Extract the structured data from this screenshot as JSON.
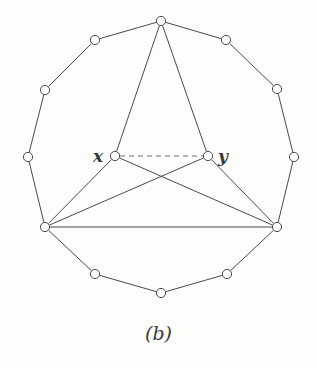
{
  "figure": {
    "caption": "(b)",
    "vertex_labels": {
      "x": "x",
      "y": "y"
    },
    "colors": {
      "edge": "#4a4a4d",
      "dashed_edge": "#6f6f72",
      "node_stroke": "#4a4a4d",
      "node_fill": "#ffffff",
      "text": "#39383b",
      "background": "#fdfdfc"
    },
    "style": {
      "node_radius": 4.6,
      "edge_width": 1.0,
      "dash_pattern": "5,4"
    }
  },
  "chart_data": {
    "type": "diagram",
    "title": "(b)",
    "subtitle": "",
    "vertices": [
      {
        "id": "v0",
        "label": "",
        "x": 161,
        "y": 21,
        "role": "apex"
      },
      {
        "id": "v1",
        "label": "",
        "x": 226,
        "y": 40,
        "role": "cycle"
      },
      {
        "id": "v2",
        "label": "",
        "x": 277,
        "y": 89,
        "role": "cycle"
      },
      {
        "id": "v3",
        "label": "",
        "x": 294,
        "y": 157,
        "role": "cycle"
      },
      {
        "id": "v4",
        "label": "",
        "x": 277,
        "y": 227,
        "role": "hub-right"
      },
      {
        "id": "v5",
        "label": "",
        "x": 227,
        "y": 274,
        "role": "cycle"
      },
      {
        "id": "v6",
        "label": "",
        "x": 161,
        "y": 293,
        "role": "cycle"
      },
      {
        "id": "v7",
        "label": "",
        "x": 95,
        "y": 274,
        "role": "cycle"
      },
      {
        "id": "v8",
        "label": "",
        "x": 45,
        "y": 227,
        "role": "hub-left"
      },
      {
        "id": "v9",
        "label": "",
        "x": 28,
        "y": 157,
        "role": "cycle"
      },
      {
        "id": "v10",
        "label": "",
        "x": 45,
        "y": 90,
        "role": "cycle"
      },
      {
        "id": "v11",
        "label": "",
        "x": 95,
        "y": 40,
        "role": "cycle"
      },
      {
        "id": "vx",
        "label": "x",
        "x": 115,
        "y": 156,
        "role": "inner-left"
      },
      {
        "id": "vy",
        "label": "y",
        "x": 208,
        "y": 156,
        "role": "inner-right"
      }
    ],
    "edges": [
      {
        "from": "v0",
        "to": "v1",
        "style": "solid"
      },
      {
        "from": "v1",
        "to": "v2",
        "style": "solid"
      },
      {
        "from": "v2",
        "to": "v3",
        "style": "solid"
      },
      {
        "from": "v3",
        "to": "v4",
        "style": "solid"
      },
      {
        "from": "v4",
        "to": "v5",
        "style": "solid"
      },
      {
        "from": "v5",
        "to": "v6",
        "style": "solid"
      },
      {
        "from": "v6",
        "to": "v7",
        "style": "solid"
      },
      {
        "from": "v7",
        "to": "v8",
        "style": "solid"
      },
      {
        "from": "v8",
        "to": "v9",
        "style": "solid"
      },
      {
        "from": "v9",
        "to": "v10",
        "style": "solid"
      },
      {
        "from": "v10",
        "to": "v11",
        "style": "solid"
      },
      {
        "from": "v11",
        "to": "v0",
        "style": "solid"
      },
      {
        "from": "v0",
        "to": "vx",
        "style": "solid"
      },
      {
        "from": "v0",
        "to": "vy",
        "style": "solid"
      },
      {
        "from": "vx",
        "to": "v8",
        "style": "solid"
      },
      {
        "from": "vy",
        "to": "v4",
        "style": "solid"
      },
      {
        "from": "vx",
        "to": "v4",
        "style": "solid"
      },
      {
        "from": "vy",
        "to": "v8",
        "style": "solid"
      },
      {
        "from": "v8",
        "to": "v4",
        "style": "solid"
      },
      {
        "from": "vx",
        "to": "vy",
        "style": "dashed"
      }
    ],
    "counts": {
      "vertices": 14,
      "edges": 20,
      "dashed_edges": 1
    }
  }
}
